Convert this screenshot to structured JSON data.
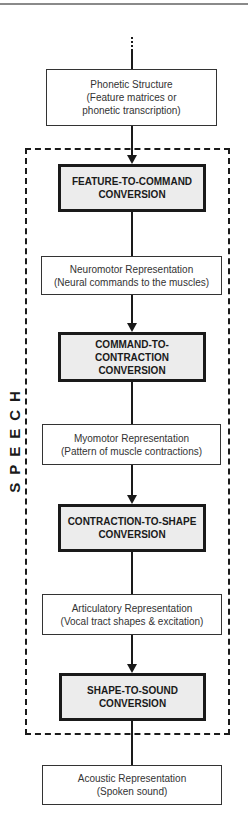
{
  "diagram": {
    "frame_label": "SPEECH",
    "nodes": [
      {
        "id": "phonetic",
        "type": "representation",
        "title": "Phonetic Structure",
        "subtitle_line1": "(Feature matrices or",
        "subtitle_line2": "phonetic transcription)"
      },
      {
        "id": "feature-to-command",
        "type": "conversion",
        "line1": "FEATURE-TO-COMMAND",
        "line2": "CONVERSION"
      },
      {
        "id": "neuromotor",
        "type": "representation",
        "title": "Neuromotor Representation",
        "subtitle": "(Neural commands to the muscles)"
      },
      {
        "id": "command-to-contraction",
        "type": "conversion",
        "line1": "COMMAND-TO-",
        "line2": "CONTRACTION",
        "line3": "CONVERSION"
      },
      {
        "id": "myomotor",
        "type": "representation",
        "title": "Myomotor Representation",
        "subtitle": "(Pattern of muscle contractions)"
      },
      {
        "id": "contraction-to-shape",
        "type": "conversion",
        "line1": "CONTRACTION-TO-SHAPE",
        "line2": "CONVERSION"
      },
      {
        "id": "articulatory",
        "type": "representation",
        "title": "Articulatory Representation",
        "subtitle": "(Vocal tract shapes & excitation)"
      },
      {
        "id": "shape-to-sound",
        "type": "conversion",
        "line1": "SHAPE-TO-SOUND",
        "line2": "CONVERSION"
      },
      {
        "id": "acoustic",
        "type": "representation",
        "title": "Acoustic Representation",
        "subtitle": "(Spoken sound)"
      }
    ],
    "colors": {
      "line": "#1a1a1a",
      "conversion_fill": "#ececec",
      "representation_fill": "#ffffff"
    }
  }
}
